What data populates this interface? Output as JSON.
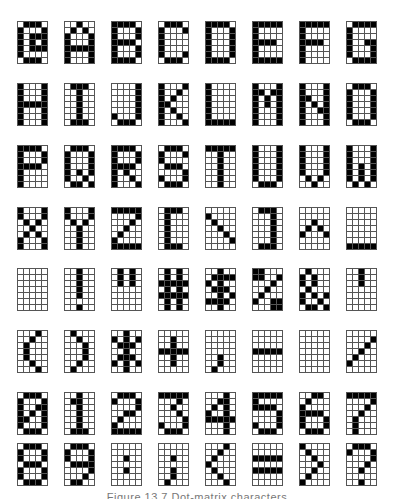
{
  "figure": {
    "grid": {
      "columns": 5,
      "rows": 7
    },
    "layout": {
      "col_x": [
        17,
        64,
        111,
        158,
        205,
        252,
        299,
        346
      ],
      "row_y": [
        21,
        83,
        145,
        207,
        268,
        330,
        392,
        443
      ]
    },
    "colors": {
      "on": "#000000",
      "off": "#ffffff",
      "grid_line": "#555555"
    },
    "caption": "Figure 13.7 Dot-matrix characters",
    "glyphs": [
      {
        "char": "@",
        "bits": [
          "01110",
          "10001",
          "10111",
          "10101",
          "10111",
          "10000",
          "01110"
        ]
      },
      {
        "char": "A",
        "bits": [
          "00100",
          "01010",
          "10001",
          "10001",
          "11111",
          "10001",
          "10001"
        ]
      },
      {
        "char": "B",
        "bits": [
          "11110",
          "10001",
          "10001",
          "11110",
          "10001",
          "10001",
          "11110"
        ]
      },
      {
        "char": "C",
        "bits": [
          "01110",
          "10001",
          "10000",
          "10000",
          "10000",
          "10001",
          "01110"
        ]
      },
      {
        "char": "D",
        "bits": [
          "11110",
          "10001",
          "10001",
          "10001",
          "10001",
          "10001",
          "11110"
        ]
      },
      {
        "char": "E",
        "bits": [
          "11111",
          "10000",
          "10000",
          "11110",
          "10000",
          "10000",
          "11111"
        ]
      },
      {
        "char": "F",
        "bits": [
          "11111",
          "10000",
          "10000",
          "11110",
          "10000",
          "10000",
          "10000"
        ]
      },
      {
        "char": "G",
        "bits": [
          "01111",
          "10000",
          "10000",
          "10011",
          "10001",
          "10001",
          "01111"
        ]
      },
      {
        "char": "H",
        "bits": [
          "10001",
          "10001",
          "10001",
          "11111",
          "10001",
          "10001",
          "10001"
        ]
      },
      {
        "char": "I",
        "bits": [
          "01110",
          "00100",
          "00100",
          "00100",
          "00100",
          "00100",
          "01110"
        ]
      },
      {
        "char": "J",
        "bits": [
          "00001",
          "00001",
          "00001",
          "00001",
          "00001",
          "10001",
          "01110"
        ]
      },
      {
        "char": "K",
        "bits": [
          "10001",
          "10010",
          "10100",
          "11000",
          "10100",
          "10010",
          "10001"
        ]
      },
      {
        "char": "L",
        "bits": [
          "10000",
          "10000",
          "10000",
          "10000",
          "10000",
          "10000",
          "11111"
        ]
      },
      {
        "char": "M",
        "bits": [
          "10001",
          "11011",
          "10101",
          "10101",
          "10001",
          "10001",
          "10001"
        ]
      },
      {
        "char": "N",
        "bits": [
          "10001",
          "10001",
          "11001",
          "10101",
          "10011",
          "10001",
          "10001"
        ]
      },
      {
        "char": "O",
        "bits": [
          "01110",
          "10001",
          "10001",
          "10001",
          "10001",
          "10001",
          "01110"
        ]
      },
      {
        "char": "P",
        "bits": [
          "11110",
          "10001",
          "10001",
          "11110",
          "10000",
          "10000",
          "10000"
        ]
      },
      {
        "char": "Q",
        "bits": [
          "01110",
          "10001",
          "10001",
          "10001",
          "10101",
          "10010",
          "01101"
        ]
      },
      {
        "char": "R",
        "bits": [
          "11110",
          "10001",
          "10001",
          "11110",
          "10100",
          "10010",
          "10001"
        ]
      },
      {
        "char": "S",
        "bits": [
          "01110",
          "10001",
          "10000",
          "01110",
          "00001",
          "10001",
          "01110"
        ]
      },
      {
        "char": "T",
        "bits": [
          "11111",
          "00100",
          "00100",
          "00100",
          "00100",
          "00100",
          "00100"
        ]
      },
      {
        "char": "U",
        "bits": [
          "10001",
          "10001",
          "10001",
          "10001",
          "10001",
          "10001",
          "01110"
        ]
      },
      {
        "char": "V",
        "bits": [
          "10001",
          "10001",
          "10001",
          "10001",
          "10001",
          "01010",
          "00100"
        ]
      },
      {
        "char": "W",
        "bits": [
          "10001",
          "10001",
          "10001",
          "10101",
          "10101",
          "10101",
          "01010"
        ]
      },
      {
        "char": "X",
        "bits": [
          "10001",
          "10001",
          "01010",
          "00100",
          "01010",
          "10001",
          "10001"
        ]
      },
      {
        "char": "Y",
        "bits": [
          "10001",
          "10001",
          "01010",
          "00100",
          "00100",
          "00100",
          "00100"
        ]
      },
      {
        "char": "Z",
        "bits": [
          "11111",
          "00001",
          "00010",
          "00100",
          "01000",
          "10000",
          "11111"
        ]
      },
      {
        "char": "[",
        "bits": [
          "01110",
          "01000",
          "01000",
          "01000",
          "01000",
          "01000",
          "01110"
        ]
      },
      {
        "char": "\\",
        "bits": [
          "00000",
          "10000",
          "01000",
          "00100",
          "00010",
          "00001",
          "00000"
        ]
      },
      {
        "char": "]",
        "bits": [
          "01110",
          "00010",
          "00010",
          "00010",
          "00010",
          "00010",
          "01110"
        ]
      },
      {
        "char": "^",
        "bits": [
          "00000",
          "00000",
          "00100",
          "01010",
          "10001",
          "00000",
          "00000"
        ]
      },
      {
        "char": "_",
        "bits": [
          "00000",
          "00000",
          "00000",
          "00000",
          "00000",
          "00000",
          "11111"
        ]
      },
      {
        "char": " ",
        "bits": [
          "00000",
          "00000",
          "00000",
          "00000",
          "00000",
          "00000",
          "00000"
        ]
      },
      {
        "char": "!",
        "bits": [
          "00100",
          "00100",
          "00100",
          "00100",
          "00100",
          "00000",
          "00100"
        ]
      },
      {
        "char": "\"",
        "bits": [
          "01010",
          "01010",
          "01010",
          "00000",
          "00000",
          "00000",
          "00000"
        ]
      },
      {
        "char": "#",
        "bits": [
          "01010",
          "01010",
          "11111",
          "01010",
          "11111",
          "01010",
          "01010"
        ]
      },
      {
        "char": "$",
        "bits": [
          "00100",
          "01111",
          "10100",
          "01110",
          "00101",
          "11110",
          "00100"
        ]
      },
      {
        "char": "%",
        "bits": [
          "11000",
          "11001",
          "00010",
          "00100",
          "01000",
          "10011",
          "00011"
        ]
      },
      {
        "char": "&",
        "bits": [
          "01000",
          "10100",
          "10100",
          "01000",
          "10101",
          "10010",
          "01101"
        ]
      },
      {
        "char": "'",
        "bits": [
          "00100",
          "00100",
          "00100",
          "00000",
          "00000",
          "00000",
          "00000"
        ]
      },
      {
        "char": "(",
        "bits": [
          "00010",
          "00100",
          "01000",
          "01000",
          "01000",
          "00100",
          "00010"
        ]
      },
      {
        "char": ")",
        "bits": [
          "01000",
          "00100",
          "00010",
          "00010",
          "00010",
          "00100",
          "01000"
        ]
      },
      {
        "char": "*",
        "bits": [
          "00100",
          "10101",
          "01110",
          "00100",
          "01110",
          "10101",
          "00100"
        ]
      },
      {
        "char": "+",
        "bits": [
          "00000",
          "00100",
          "00100",
          "11111",
          "00100",
          "00100",
          "00000"
        ]
      },
      {
        "char": ",",
        "bits": [
          "00000",
          "00000",
          "00000",
          "00000",
          "00100",
          "00100",
          "01000"
        ]
      },
      {
        "char": "-",
        "bits": [
          "00000",
          "00000",
          "00000",
          "11111",
          "00000",
          "00000",
          "00000"
        ]
      },
      {
        "char": ".",
        "bits": [
          "00000",
          "00000",
          "00000",
          "00000",
          "00000",
          "00000",
          "00000"
        ]
      },
      {
        "char": "/",
        "bits": [
          "00000",
          "00001",
          "00010",
          "00100",
          "01000",
          "10000",
          "00000"
        ]
      },
      {
        "char": "0",
        "bits": [
          "01110",
          "10001",
          "10011",
          "10101",
          "11001",
          "10001",
          "01110"
        ]
      },
      {
        "char": "1",
        "bits": [
          "00100",
          "01100",
          "00100",
          "00100",
          "00100",
          "00100",
          "01110"
        ]
      },
      {
        "char": "2",
        "bits": [
          "01110",
          "10001",
          "00001",
          "00110",
          "01000",
          "10000",
          "11111"
        ]
      },
      {
        "char": "3",
        "bits": [
          "11111",
          "00010",
          "00100",
          "00010",
          "00001",
          "10001",
          "01110"
        ]
      },
      {
        "char": "4",
        "bits": [
          "00010",
          "00110",
          "01010",
          "10010",
          "11111",
          "00010",
          "00010"
        ]
      },
      {
        "char": "5",
        "bits": [
          "11111",
          "10000",
          "11110",
          "00001",
          "00001",
          "10001",
          "01110"
        ]
      },
      {
        "char": "6",
        "bits": [
          "00110",
          "01000",
          "10000",
          "11110",
          "10001",
          "10001",
          "01110"
        ]
      },
      {
        "char": "7",
        "bits": [
          "11111",
          "00001",
          "00010",
          "00100",
          "01000",
          "01000",
          "01000"
        ]
      },
      {
        "char": "8",
        "bits": [
          "01110",
          "10001",
          "10001",
          "01110",
          "10001",
          "10001",
          "01110"
        ]
      },
      {
        "char": "9",
        "bits": [
          "01110",
          "10001",
          "10001",
          "01111",
          "00001",
          "00010",
          "01100"
        ]
      },
      {
        "char": ":",
        "bits": [
          "00000",
          "00000",
          "00100",
          "00000",
          "00100",
          "00000",
          "00000"
        ]
      },
      {
        "char": ";",
        "bits": [
          "00000",
          "00000",
          "00100",
          "00000",
          "00100",
          "00100",
          "01000"
        ]
      },
      {
        "char": "<",
        "bits": [
          "00010",
          "00100",
          "01000",
          "10000",
          "01000",
          "00100",
          "00010"
        ]
      },
      {
        "char": "=",
        "bits": [
          "00000",
          "00000",
          "11111",
          "00000",
          "11111",
          "00000",
          "00000"
        ]
      },
      {
        "char": ">",
        "bits": [
          "10000",
          "01000",
          "00100",
          "00010",
          "00100",
          "01000",
          "10000"
        ]
      },
      {
        "char": "?",
        "bits": [
          "01110",
          "10001",
          "00001",
          "00010",
          "00100",
          "00000",
          "00100"
        ]
      }
    ]
  }
}
